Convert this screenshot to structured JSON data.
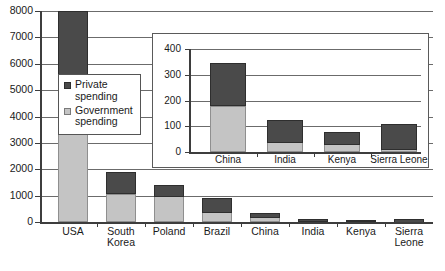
{
  "chart_data": [
    {
      "id": "main",
      "type": "bar",
      "subtype": "stacked",
      "title": "",
      "xlabel": "",
      "ylabel": "",
      "ylim": [
        0,
        8000
      ],
      "yticks": [
        0,
        1000,
        2000,
        3000,
        4000,
        5000,
        6000,
        7000,
        8000
      ],
      "ytick_labels": [
        "0",
        "1000",
        "2000",
        "3000",
        "4000",
        "5000",
        "6000",
        "7000",
        "8000"
      ],
      "grid": true,
      "categories": [
        "USA",
        "South\nKorea",
        "Poland",
        "Brazil",
        "China",
        "India",
        "Kenya",
        "Sierra\nLeone"
      ],
      "series": [
        {
          "name": "Government spending",
          "color": "#c4c4c4",
          "values": [
            3800,
            1080,
            1000,
            380,
            180,
            38,
            32,
            12
          ]
        },
        {
          "name": "Private spending",
          "color": "#4a4a4a",
          "values": [
            4200,
            800,
            400,
            540,
            165,
            87,
            45,
            98
          ]
        }
      ],
      "totals": [
        8000,
        1880,
        1400,
        920,
        345,
        125,
        77,
        110
      ]
    },
    {
      "id": "inset",
      "type": "bar",
      "subtype": "stacked",
      "title": "",
      "xlabel": "",
      "ylabel": "",
      "ylim": [
        0,
        400
      ],
      "yticks": [
        0,
        100,
        200,
        300,
        400
      ],
      "ytick_labels": [
        "0",
        "100",
        "200",
        "300",
        "400"
      ],
      "grid": true,
      "categories": [
        "China",
        "India",
        "Kenya",
        "Sierra Leone"
      ],
      "series": [
        {
          "name": "Government spending",
          "color": "#c4c4c4",
          "values": [
            180,
            38,
            32,
            12
          ]
        },
        {
          "name": "Private spending",
          "color": "#4a4a4a",
          "values": [
            165,
            87,
            45,
            98
          ]
        }
      ],
      "totals": [
        345,
        125,
        77,
        110
      ]
    }
  ],
  "legend": {
    "position": "inside-left",
    "entries": [
      {
        "label": "Private\nspending",
        "color": "#4a4a4a",
        "swatch": "private"
      },
      {
        "label": "Government\nspending",
        "color": "#c4c4c4",
        "swatch": "gov"
      }
    ]
  },
  "colors": {
    "private": "#4a4a4a",
    "government": "#c4c4c4",
    "axis": "#3d3d3d",
    "grid": "#6b6b6b",
    "background": "#ffffff"
  }
}
